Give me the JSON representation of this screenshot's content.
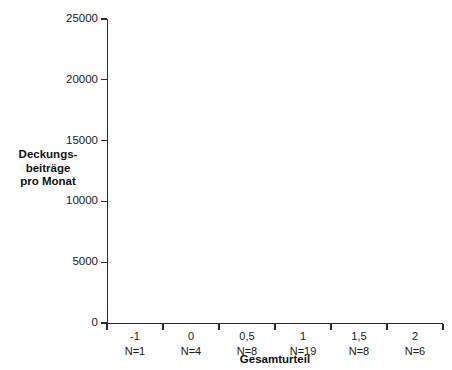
{
  "chart_data": {
    "type": "bar",
    "title": "",
    "xlabel": "Gesamturteil",
    "ylabel": "Deckungs-beiträge pro Monat",
    "ylabel_lines": [
      "Deckungs-",
      "beiträge",
      "pro Monat"
    ],
    "categories": [
      "-1",
      "0",
      "0,5",
      "1",
      "1,5",
      "2"
    ],
    "group_sizes": [
      "N=1",
      "N=4",
      "N=8",
      "N=19",
      "N=8",
      "N=6"
    ],
    "values": [
      8801,
      14270,
      19735,
      20174,
      23436,
      23867
    ],
    "value_labels": [
      "8801",
      "14270",
      "19735",
      "20174",
      "23436",
      "23867"
    ],
    "ylim": [
      0,
      25000
    ],
    "yticks": [
      0,
      5000,
      10000,
      15000,
      20000,
      25000
    ],
    "ytick_labels": [
      "0",
      "5000",
      "10000",
      "15000",
      "20000",
      "25000"
    ],
    "grid": false,
    "legend": false,
    "style": "3d-bar",
    "colors": {
      "bar_front": "#c9c9c9",
      "bar_side": "#3c3c3c",
      "bar_top": "#2e2e2e",
      "bar_outline": "#3a3a3a",
      "axis": "#2b2b2b",
      "text": "#1a1a1a",
      "background": "#ffffff"
    }
  }
}
